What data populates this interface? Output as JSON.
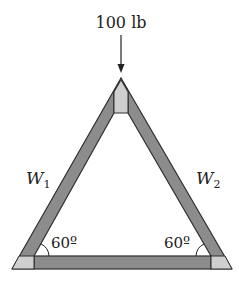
{
  "diagram": {
    "type": "truss-triangle",
    "load": {
      "label": "100 lb",
      "direction": "down"
    },
    "members": [
      {
        "name": "W",
        "subscript": "1",
        "side": "left"
      },
      {
        "name": "W",
        "subscript": "2",
        "side": "right"
      }
    ],
    "angles": [
      {
        "label": "60º",
        "position": "bottom-left"
      },
      {
        "label": "60º",
        "position": "bottom-right"
      }
    ],
    "colors": {
      "member_fill": "#8c8c8c",
      "member_stroke": "#2e2e2e",
      "joint_fill": "#cfcfcf",
      "text": "#222222"
    }
  }
}
